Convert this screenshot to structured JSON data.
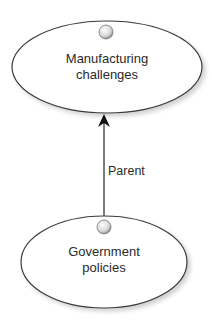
{
  "diagram": {
    "nodes": [
      {
        "id": "manufacturing",
        "line1": "Manufacturing",
        "line2": "challenges"
      },
      {
        "id": "government",
        "line1": "Government",
        "line2": "policies"
      }
    ],
    "edges": [
      {
        "from": "government",
        "to": "manufacturing",
        "label": "Parent"
      }
    ]
  },
  "colors": {
    "outline": "#3a3a3a",
    "fill": "#ffffff",
    "text": "#2a2a2a"
  }
}
